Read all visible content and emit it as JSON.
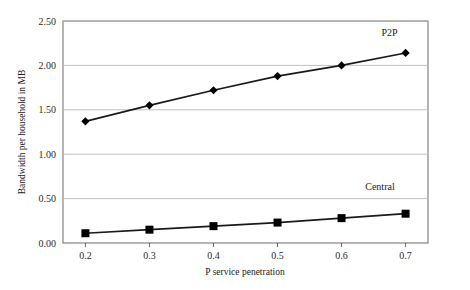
{
  "chart_data": {
    "type": "line",
    "title": "",
    "xlabel": "P service penetration",
    "ylabel": "Bandwidth per household in MB",
    "x": [
      0.2,
      0.3,
      0.4,
      0.5,
      0.6,
      0.7
    ],
    "xtick_labels": [
      "0.2",
      "0.3",
      "0.4",
      "0.5",
      "0.6",
      "0.7"
    ],
    "ytick_labels": [
      "0.00",
      "0.50",
      "1.00",
      "1.50",
      "2.00",
      "2.50"
    ],
    "ytick_values": [
      0.0,
      0.5,
      1.0,
      1.5,
      2.0,
      2.5
    ],
    "xlim": [
      0.165,
      0.735
    ],
    "ylim": [
      0,
      2.5
    ],
    "grid": "horizontal",
    "legend": "inline-annotations",
    "series": [
      {
        "name": "P2P",
        "label": "P2P",
        "marker": "diamond",
        "color": "#000000",
        "values": [
          1.37,
          1.55,
          1.72,
          1.88,
          2.0,
          2.14
        ],
        "annotation": {
          "text": "P2P",
          "x": 0.675,
          "y": 2.33
        }
      },
      {
        "name": "Central",
        "label": "Central",
        "marker": "square",
        "color": "#000000",
        "values": [
          0.11,
          0.15,
          0.19,
          0.23,
          0.28,
          0.33
        ],
        "annotation": {
          "text": "Central",
          "x": 0.66,
          "y": 0.6
        }
      }
    ],
    "colors": {
      "line": "#1a1a1a",
      "marker": "#000000",
      "gridline": "#b9b9b9",
      "frame": "#5a5a5a",
      "background": "#ffffff",
      "text": "#1a1a1a"
    }
  }
}
